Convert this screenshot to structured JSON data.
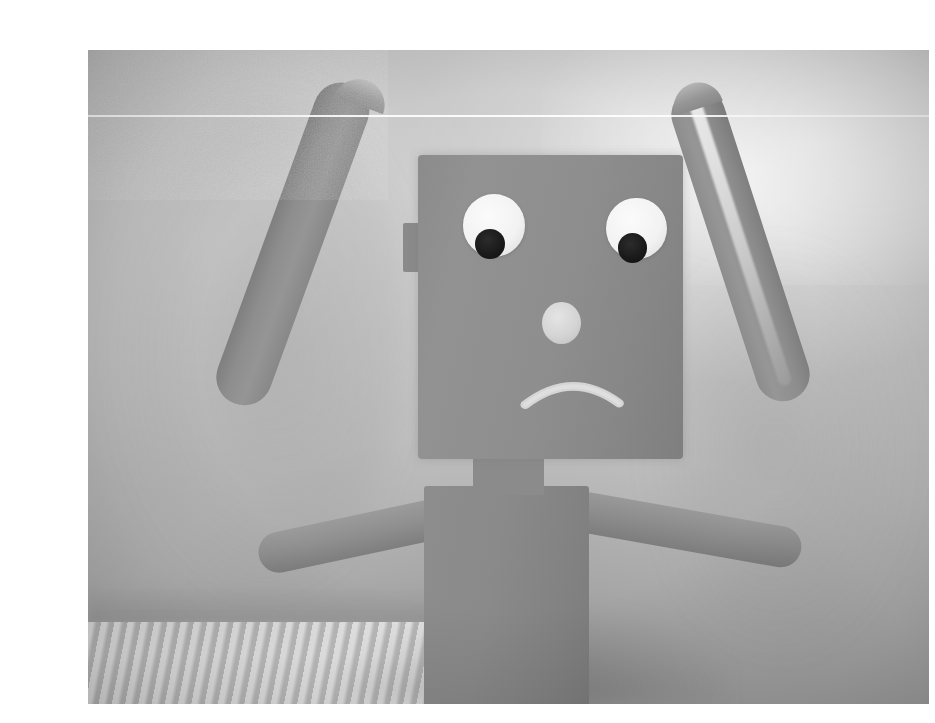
{
  "page": {
    "type": "photograph",
    "width": 935,
    "height": 723,
    "background_color": "#ffffff",
    "color_mode": "grayscale",
    "caption": ""
  },
  "photo": {
    "name": "toy-robot-photo",
    "x": 48,
    "y": 34,
    "width": 841,
    "height": 654,
    "description": "Close-up grayscale photograph of a small wooden or foam toy robot figure with a square head, raised bent arms, and a sad frowning face, standing in front of a plain pale wall.",
    "border_color": "#ffffff"
  },
  "scene": {
    "background": {
      "name": "wall",
      "label": "Plain out-of-focus pale wall",
      "base_color": "#c3c3c3",
      "highlight_color": "#f0f0f0",
      "shadow_color": "#9c9c9c"
    },
    "surface": {
      "name": "fabric-surface",
      "label": "Ribbed knitted fabric surface, bottom left",
      "color": "#cfcfcf"
    },
    "artifacts": [
      {
        "name": "scan-line",
        "label": "Bright horizontal scan line artifact",
        "color": "#ffffff",
        "position_percent": 9.9
      },
      {
        "name": "film-grain",
        "label": "Heavy film grain / sensor noise"
      },
      {
        "name": "vignette",
        "label": "Soft corner vignette"
      }
    ]
  },
  "subject": {
    "name": "toy-robot",
    "label": "Sad toy robot",
    "mood": "sad",
    "pose": "both arms raised and bent at the elbows",
    "body_color": "#8c8c8c",
    "parts": [
      {
        "name": "head",
        "label": "Square head block",
        "color": "#8e8e8e"
      },
      {
        "name": "head-ear",
        "label": "Small side tab on left of head",
        "color": "#8a8a8a"
      },
      {
        "name": "neck",
        "label": "Short neck connector",
        "color": "#8b8b8b"
      },
      {
        "name": "torso",
        "label": "Rectangular torso block",
        "color": "#878787"
      },
      {
        "name": "left-arm",
        "label": "Raised left arm bent into a U shape",
        "color": "#8d8d8d"
      },
      {
        "name": "right-arm",
        "label": "Raised right arm bent into a U shape with a bright highlight edge",
        "color": "#8d8d8d"
      }
    ],
    "face": {
      "left_eye": {
        "name": "left-eye",
        "label": "Left googly eye",
        "sclera_color": "#f4f4f4",
        "pupil_color": "#151515",
        "pupil_position": "lower-left"
      },
      "right_eye": {
        "name": "right-eye",
        "label": "Right googly eye",
        "sclera_color": "#f2f2f2",
        "pupil_color": "#151515",
        "pupil_position": "lower-left"
      },
      "nose": {
        "name": "nose",
        "label": "Round light-colored nose",
        "color": "#dcdcdc",
        "shape": "circle"
      },
      "mouth": {
        "name": "mouth",
        "label": "Downturned frown arc",
        "color": "#d8d8d8",
        "shape": "frown-arc"
      }
    }
  }
}
